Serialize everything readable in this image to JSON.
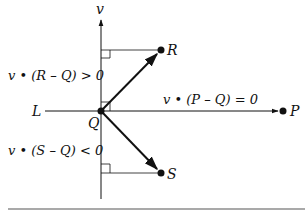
{
  "diagram": {
    "axis_label": "v",
    "line_label": "L",
    "points": {
      "Q": {
        "label": "Q",
        "x": 101,
        "y": 111
      },
      "R": {
        "label": "R",
        "x": 161,
        "y": 50
      },
      "S": {
        "label": "S",
        "x": 161,
        "y": 173
      },
      "P": {
        "label": "P",
        "x": 283,
        "y": 111
      }
    },
    "equations": {
      "r": "v • (R – Q) > 0",
      "p": "v • (P – Q) = 0",
      "s": "v • (S – Q) < 0"
    },
    "colors": {
      "ink": "#111111",
      "background": "#ffffff",
      "rule": "#555555"
    }
  }
}
